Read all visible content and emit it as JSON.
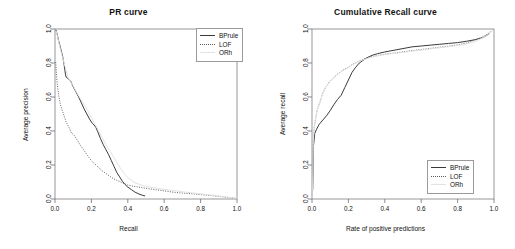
{
  "chart_data": [
    {
      "type": "line",
      "title": "PR curve",
      "xlabel": "Recall",
      "ylabel": "Average precision",
      "xlim": [
        0,
        1
      ],
      "ylim": [
        0,
        1
      ],
      "xticks": [
        "0.0",
        "0.2",
        "0.4",
        "0.6",
        "0.8",
        "1.0"
      ],
      "yticks": [
        "0.0",
        "0.2",
        "0.4",
        "0.6",
        "0.8",
        "1.0"
      ],
      "grid": false,
      "legend_position": "top-right",
      "series": [
        {
          "name": "BPrule",
          "style": "solid",
          "color": "#3a3a3a",
          "x": [
            0.005,
            0.012,
            0.02,
            0.03,
            0.042,
            0.05,
            0.058,
            0.062,
            0.07,
            0.085,
            0.1,
            0.115,
            0.13,
            0.145,
            0.16,
            0.175,
            0.19,
            0.205,
            0.215,
            0.225,
            0.235,
            0.25,
            0.265,
            0.28,
            0.295,
            0.31,
            0.325,
            0.34,
            0.355,
            0.37,
            0.385,
            0.4,
            0.42,
            0.44,
            0.46,
            0.48,
            0.495
          ],
          "y": [
            0.995,
            0.97,
            0.93,
            0.89,
            0.84,
            0.79,
            0.73,
            0.715,
            0.71,
            0.695,
            0.66,
            0.63,
            0.6,
            0.565,
            0.53,
            0.5,
            0.47,
            0.445,
            0.435,
            0.42,
            0.395,
            0.355,
            0.32,
            0.29,
            0.26,
            0.225,
            0.19,
            0.155,
            0.13,
            0.105,
            0.085,
            0.07,
            0.055,
            0.04,
            0.03,
            0.022,
            0.018
          ]
        },
        {
          "name": "LOF",
          "style": "dotted",
          "color": "#5a5a5a",
          "x": [
            0.004,
            0.01,
            0.02,
            0.03,
            0.04,
            0.05,
            0.06,
            0.075,
            0.09,
            0.105,
            0.12,
            0.14,
            0.16,
            0.18,
            0.2,
            0.22,
            0.24,
            0.26,
            0.28,
            0.3,
            0.32,
            0.34,
            0.36,
            0.38,
            0.4,
            0.43,
            0.46,
            0.5,
            0.55,
            0.6,
            0.65,
            0.7,
            0.78,
            0.86,
            0.93,
            1.0
          ],
          "y": [
            0.805,
            0.7,
            0.61,
            0.555,
            0.52,
            0.49,
            0.455,
            0.425,
            0.39,
            0.375,
            0.35,
            0.315,
            0.285,
            0.255,
            0.225,
            0.205,
            0.185,
            0.165,
            0.15,
            0.135,
            0.12,
            0.11,
            0.1,
            0.09,
            0.082,
            0.075,
            0.07,
            0.063,
            0.055,
            0.048,
            0.04,
            0.035,
            0.028,
            0.02,
            0.012,
            0.003
          ]
        },
        {
          "name": "ORh",
          "style": "solid",
          "color": "#e2e2e2",
          "x": [
            0.006,
            0.015,
            0.025,
            0.04,
            0.055,
            0.07,
            0.085,
            0.1,
            0.12,
            0.14,
            0.16,
            0.18,
            0.2,
            0.22,
            0.24,
            0.26,
            0.28,
            0.3,
            0.32,
            0.34,
            0.36,
            0.38,
            0.4,
            0.44,
            0.48,
            0.52,
            0.58,
            0.65,
            0.72,
            0.8,
            0.88,
            0.95,
            1.0
          ],
          "y": [
            0.99,
            0.95,
            0.9,
            0.84,
            0.78,
            0.72,
            0.69,
            0.665,
            0.625,
            0.59,
            0.555,
            0.52,
            0.48,
            0.44,
            0.4,
            0.36,
            0.32,
            0.285,
            0.25,
            0.215,
            0.18,
            0.15,
            0.125,
            0.095,
            0.08,
            0.07,
            0.06,
            0.05,
            0.04,
            0.03,
            0.02,
            0.01,
            0.004
          ]
        }
      ]
    },
    {
      "type": "line",
      "title": "Cumulative Recall curve",
      "xlabel": "Rate of positive predictions",
      "ylabel": "Average recall",
      "xlim": [
        0,
        1
      ],
      "ylim": [
        0,
        1
      ],
      "xticks": [
        "0.0",
        "0.2",
        "0.4",
        "0.6",
        "0.8",
        "1.0"
      ],
      "yticks": [
        "0.0",
        "0.2",
        "0.4",
        "0.6",
        "0.8",
        "1.0"
      ],
      "grid": false,
      "legend_position": "bottom-right",
      "series": [
        {
          "name": "BPrule",
          "style": "solid",
          "color": "#3a3a3a",
          "x": [
            0.004,
            0.008,
            0.015,
            0.025,
            0.04,
            0.06,
            0.08,
            0.1,
            0.12,
            0.14,
            0.16,
            0.18,
            0.2,
            0.22,
            0.24,
            0.26,
            0.28,
            0.3,
            0.33,
            0.36,
            0.4,
            0.45,
            0.5,
            0.55,
            0.6,
            0.65,
            0.7,
            0.75,
            0.8,
            0.85,
            0.9,
            0.94,
            0.96,
            0.975
          ],
          "y": [
            0.055,
            0.31,
            0.385,
            0.41,
            0.44,
            0.465,
            0.49,
            0.52,
            0.555,
            0.585,
            0.61,
            0.655,
            0.7,
            0.745,
            0.775,
            0.8,
            0.815,
            0.83,
            0.845,
            0.855,
            0.865,
            0.875,
            0.885,
            0.895,
            0.9,
            0.905,
            0.91,
            0.915,
            0.92,
            0.928,
            0.938,
            0.95,
            0.962,
            0.972
          ]
        },
        {
          "name": "LOF",
          "style": "dotted",
          "color": "#5a5a5a",
          "x": [
            0.003,
            0.006,
            0.012,
            0.02,
            0.03,
            0.045,
            0.06,
            0.08,
            0.1,
            0.12,
            0.14,
            0.16,
            0.18,
            0.2,
            0.22,
            0.24,
            0.26,
            0.28,
            0.31,
            0.35,
            0.4,
            0.45,
            0.5,
            0.56,
            0.62,
            0.68,
            0.74,
            0.8,
            0.85,
            0.9,
            0.94,
            0.97,
            0.99
          ],
          "y": [
            0.05,
            0.33,
            0.42,
            0.475,
            0.53,
            0.575,
            0.625,
            0.665,
            0.695,
            0.715,
            0.735,
            0.75,
            0.765,
            0.775,
            0.79,
            0.8,
            0.812,
            0.822,
            0.832,
            0.842,
            0.852,
            0.858,
            0.866,
            0.874,
            0.882,
            0.89,
            0.898,
            0.906,
            0.918,
            0.938,
            0.955,
            0.975,
            0.99
          ]
        },
        {
          "name": "ORh",
          "style": "solid",
          "color": "#e2e2e2",
          "x": [
            0.003,
            0.007,
            0.013,
            0.022,
            0.033,
            0.048,
            0.065,
            0.085,
            0.105,
            0.125,
            0.145,
            0.165,
            0.185,
            0.205,
            0.225,
            0.25,
            0.275,
            0.3,
            0.34,
            0.38,
            0.43,
            0.48,
            0.54,
            0.6,
            0.66,
            0.72,
            0.78,
            0.84,
            0.89,
            0.93,
            0.96,
            0.985
          ],
          "y": [
            0.05,
            0.34,
            0.43,
            0.485,
            0.54,
            0.585,
            0.635,
            0.672,
            0.7,
            0.72,
            0.738,
            0.752,
            0.766,
            0.778,
            0.792,
            0.805,
            0.816,
            0.826,
            0.838,
            0.846,
            0.854,
            0.86,
            0.868,
            0.876,
            0.884,
            0.892,
            0.9,
            0.91,
            0.924,
            0.944,
            0.962,
            0.982
          ]
        }
      ]
    }
  ],
  "panels": [
    {
      "title": "PR curve",
      "xlabel": "Recall",
      "ylabel": "Average precision",
      "legend": [
        {
          "label": "BPrule",
          "key": "solid"
        },
        {
          "label": "LOF",
          "key": "dotted"
        },
        {
          "label": "ORh",
          "key": "gray"
        }
      ]
    },
    {
      "title": "Cumulative Recall curve",
      "xlabel": "Rate of positive predictions",
      "ylabel": "Average recall",
      "legend": [
        {
          "label": "BPrule",
          "key": "solid"
        },
        {
          "label": "LOF",
          "key": "dotted"
        },
        {
          "label": "ORh",
          "key": "gray"
        }
      ]
    }
  ]
}
